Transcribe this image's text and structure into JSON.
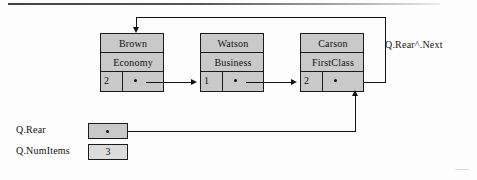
{
  "figure": {
    "colors": {
      "node_fill": "#c9c9c9",
      "line": "#111111",
      "background": "#fdfdfd"
    }
  },
  "nodes": [
    {
      "name": "Brown",
      "klass": "Economy",
      "count": "2"
    },
    {
      "name": "Watson",
      "klass": "Business",
      "count": "1"
    },
    {
      "name": "Carson",
      "klass": "FirstClass",
      "count": "2"
    }
  ],
  "labels": {
    "rear_next": "Q.Rear^.Next",
    "q_rear": "Q.Rear",
    "q_numitems": "Q.NumItems"
  },
  "variables": {
    "q_rear_value": "",
    "q_numitems_value": "3"
  },
  "icons": {
    "pointer_dot": "pointer-dot-icon",
    "arrow_right": "arrow-right-icon",
    "arrow_down": "arrow-down-icon",
    "arrow_up": "arrow-up-icon"
  }
}
